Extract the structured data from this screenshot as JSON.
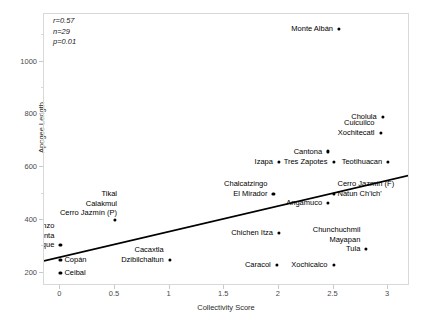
{
  "chart_data": {
    "type": "scatter",
    "title": "",
    "xlabel": "Collectivity Score",
    "ylabel": "Apogee Length",
    "xlim": [
      -0.15,
      3.2
    ],
    "ylim": [
      150,
      1180
    ],
    "grid": false,
    "legend": null,
    "annotations": {
      "r": "r=0.57",
      "n": "n=29",
      "p": "p=0.01"
    },
    "xticks": [
      0,
      0.5,
      1,
      1.5,
      2,
      2.5,
      3
    ],
    "xtick_labels": [
      "0",
      "0.5",
      "1",
      "1.5",
      "2",
      "2.5",
      "3"
    ],
    "yticks": [
      200,
      400,
      600,
      800,
      1000
    ],
    "ytick_labels": [
      "200",
      "400",
      "600",
      "800",
      "1000"
    ],
    "yticks_minor": [
      300,
      500,
      700,
      900,
      1100
    ],
    "trendline": {
      "type": "linear",
      "x_start": -0.15,
      "y_start": 245,
      "x_end": 3.2,
      "y_end": 570
    },
    "points": [
      {
        "label": "Ceibal",
        "x": 0,
        "y": 200,
        "label_pos": "right"
      },
      {
        "label": "Copán",
        "x": 0,
        "y": 250,
        "label_pos": "right"
      },
      {
        "label": "San Lorenzo\nLa Venta\nPalenque",
        "x": 0,
        "y": 305,
        "label_pos": "left-stack"
      },
      {
        "label": "Tikal\nCalakmul\nCerro Jazmín (P)",
        "x": 0.5,
        "y": 400,
        "label_pos": "above"
      },
      {
        "label": "Cacaxtla\nDzibilchaltun",
        "x": 1,
        "y": 250,
        "label_pos": "left-stack"
      },
      {
        "label": "Izapa",
        "x": 2,
        "y": 620,
        "label_pos": "left"
      },
      {
        "label": "Chalcatzingo\nEl Mirador",
        "x": 1.95,
        "y": 500,
        "label_pos": "left-stack"
      },
      {
        "label": "Chichen Itza",
        "x": 2.0,
        "y": 350,
        "label_pos": "left"
      },
      {
        "label": "Caracol",
        "x": 1.98,
        "y": 230,
        "label_pos": "left"
      },
      {
        "label": "Xochicalco",
        "x": 2.5,
        "y": 230,
        "label_pos": "left"
      },
      {
        "label": "Tres Zapotes",
        "x": 2.5,
        "y": 620,
        "label_pos": "left"
      },
      {
        "label": "Cantona",
        "x": 2.45,
        "y": 660,
        "label_pos": "left"
      },
      {
        "label": "Monte Albán",
        "x": 2.55,
        "y": 1125,
        "label_pos": "left"
      },
      {
        "label": "Angamuco",
        "x": 2.45,
        "y": 465,
        "label_pos": "left"
      },
      {
        "label": "Cerro Jazmín (F)\nNatun Ch'ich'",
        "x": 2.5,
        "y": 500,
        "label_pos": "right-stack"
      },
      {
        "label": "Chunchuchmil\nMayapan\nTula",
        "x": 2.8,
        "y": 290,
        "label_pos": "left-stack"
      },
      {
        "label": "Teotihuacan",
        "x": 3.0,
        "y": 620,
        "label_pos": "left"
      },
      {
        "label": "Tetichuacan",
        "x": 3.0,
        "y": 620,
        "label_pos": "hidden"
      },
      {
        "label": "Cholula",
        "x": 2.95,
        "y": 790,
        "label_pos": "left"
      },
      {
        "label": "Cuicuilco\nXochitecatl",
        "x": 2.93,
        "y": 730,
        "label_pos": "left-stack"
      }
    ]
  }
}
